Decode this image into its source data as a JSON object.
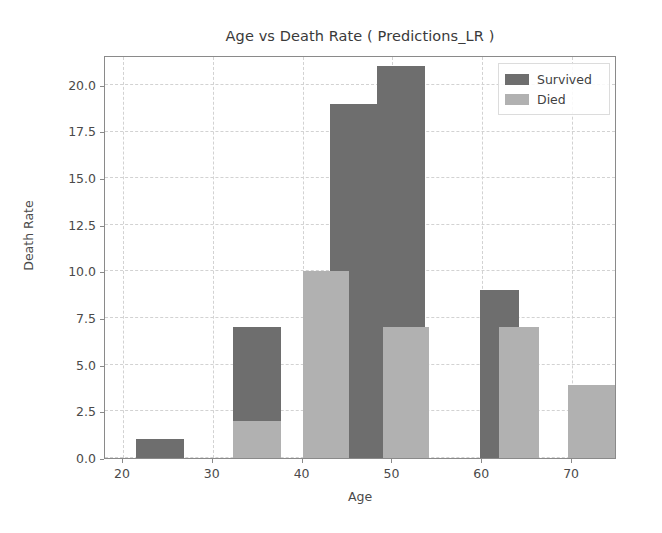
{
  "chart_data": {
    "type": "bar",
    "title": "Age vs Death Rate ( Predictions_LR )",
    "xlabel": "Age",
    "ylabel": "Death Rate",
    "xlim": [
      18.0,
      75.0
    ],
    "ylim": [
      0,
      21.6
    ],
    "grid": true,
    "legend_position": "upper right",
    "xticks": [
      20,
      30,
      40,
      50,
      60,
      70
    ],
    "xtick_labels": [
      "20",
      "30",
      "40",
      "50",
      "60",
      "70"
    ],
    "yticks": [
      0.0,
      2.5,
      5.0,
      7.5,
      10.0,
      12.5,
      15.0,
      17.5,
      20.0
    ],
    "ytick_labels": [
      "0.0",
      "2.5",
      "5.0",
      "7.5",
      "10.0",
      "12.5",
      "15.0",
      "17.5",
      "20.0"
    ],
    "series": [
      {
        "name": "Survived",
        "color": "#6e6e6e",
        "bars": [
          {
            "x_start": 21.5,
            "x_end": 26.8,
            "value": 1
          },
          {
            "x_start": 32.2,
            "x_end": 37.6,
            "value": 7
          },
          {
            "x_start": 43.0,
            "x_end": 48.3,
            "value": 19
          },
          {
            "x_start": 48.3,
            "x_end": 53.6,
            "value": 21
          },
          {
            "x_start": 59.8,
            "x_end": 64.1,
            "value": 9
          },
          {
            "x_start": 69.5,
            "x_end": 70.6,
            "value": 3.9
          }
        ]
      },
      {
        "name": "Died",
        "color": "#b1b1b1",
        "bars": [
          {
            "x_start": 32.2,
            "x_end": 37.6,
            "value": 2
          },
          {
            "x_start": 40.0,
            "x_end": 45.2,
            "value": 10
          },
          {
            "x_start": 48.9,
            "x_end": 54.1,
            "value": 7
          },
          {
            "x_start": 61.9,
            "x_end": 66.3,
            "value": 7
          },
          {
            "x_start": 69.5,
            "x_end": 74.9,
            "value": 3.9
          }
        ]
      }
    ],
    "legend_entries": [
      "Survived",
      "Died"
    ]
  },
  "legend": {
    "survived_label": "Survived",
    "died_label": "Died"
  },
  "axes": {
    "title": "Age vs Death Rate ( Predictions_LR )",
    "x_title": "Age",
    "y_title": "Death Rate"
  }
}
